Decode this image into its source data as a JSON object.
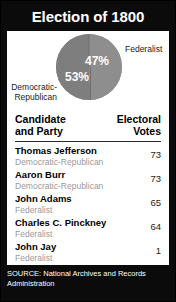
{
  "title": "Election of 1800",
  "chart_data": {
    "type": "pie",
    "title": "Election of 1800",
    "categories": [
      "Democratic-Republican",
      "Federalist"
    ],
    "values": [
      53,
      47
    ],
    "value_labels": [
      "53%",
      "47%"
    ],
    "legend_position": "outside-labels",
    "slice_colors": [
      "#7e7e7e",
      "#8e8e8e"
    ],
    "labels": {
      "federalist": "Federalist",
      "democratic_republican_line1": "Democratic-",
      "democratic_republican_line2": "Republican",
      "pct_federalist": "47%",
      "pct_democratic_republican": "53%"
    },
    "table": {
      "columns": [
        "Candidate and Party",
        "Electoral Votes"
      ],
      "rows": [
        {
          "name": "Thomas Jefferson",
          "party": "Democratic-Republican",
          "votes": "73"
        },
        {
          "name": "Aaron Burr",
          "party": "Democratic-Republican",
          "votes": "73"
        },
        {
          "name": "John Adams",
          "party": "Federalist",
          "votes": "65"
        },
        {
          "name": "Charles C. Pinckney",
          "party": "Federalist",
          "votes": "64"
        },
        {
          "name": "John Jay",
          "party": "Federalist",
          "votes": "1"
        }
      ]
    }
  },
  "table_header": {
    "candidate_line1": "Candidate",
    "candidate_line2": "and Party",
    "votes_line1": "Electoral",
    "votes_line2": "Votes"
  },
  "footer": {
    "source_line1": "SOURCE: National Archives and Records",
    "source_line2": "Administration"
  }
}
